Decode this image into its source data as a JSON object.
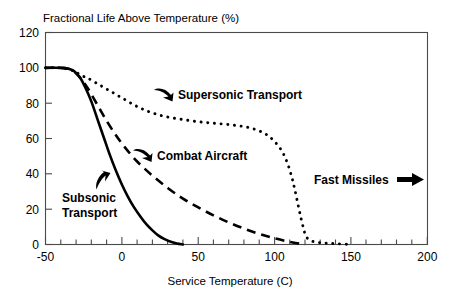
{
  "chart_data": {
    "type": "line",
    "title": "Fractional Life Above Temperature (%)",
    "xlabel": "Service Temperature (C)",
    "ylabel": "",
    "xlim": [
      -50,
      200
    ],
    "ylim": [
      0,
      120
    ],
    "xticks": [
      -50,
      0,
      50,
      100,
      150,
      200
    ],
    "xtick_labels": [
      "-50",
      "0",
      "50",
      "100",
      "150",
      "200"
    ],
    "yticks": [
      0,
      20,
      40,
      60,
      80,
      100,
      120
    ],
    "ytick_labels": [
      "0",
      "20",
      "40",
      "60",
      "80",
      "100",
      "120"
    ],
    "x_minor_tick_step": 10,
    "grid": false,
    "legend": "none",
    "series": [
      {
        "name": "Subsonic Transport",
        "style": "solid",
        "x": [
          -50,
          -40,
          -35,
          -32,
          -30,
          -27,
          -24,
          -20,
          -16,
          -12,
          -8,
          -4,
          0,
          4,
          8,
          12,
          16,
          20,
          24,
          28,
          32,
          36,
          40
        ],
        "values": [
          100,
          100,
          99.5,
          98.5,
          97,
          94,
          89,
          81,
          71,
          61,
          51,
          42,
          34,
          27,
          21,
          16,
          11.5,
          8,
          5,
          3,
          1.5,
          0.6,
          0
        ]
      },
      {
        "name": "Combat Aircraft",
        "style": "dashed",
        "x": [
          -50,
          -40,
          -35,
          -32,
          -30,
          -26,
          -22,
          -16,
          -10,
          -4,
          2,
          10,
          20,
          30,
          40,
          50,
          60,
          70,
          80,
          90,
          100,
          110,
          120
        ],
        "values": [
          100,
          100,
          99.5,
          98.5,
          97,
          93,
          88,
          79,
          70,
          62,
          55,
          47,
          39,
          32,
          26,
          21,
          16.5,
          12.5,
          9,
          6,
          3.5,
          1.5,
          0
        ]
      },
      {
        "name": "Supersonic Transport",
        "style": "dotted",
        "x": [
          -50,
          -40,
          -34,
          -30,
          -26,
          -22,
          -16,
          -10,
          -4,
          2,
          8,
          14,
          20,
          28,
          38,
          50,
          62,
          74,
          84,
          92,
          98,
          104,
          108,
          111,
          113,
          115,
          117,
          119,
          121,
          126,
          133,
          141,
          150
        ],
        "values": [
          100,
          100,
          99,
          97.5,
          95.5,
          94,
          91,
          88,
          85,
          82,
          79,
          76.5,
          74.5,
          72.5,
          71,
          69.5,
          68.5,
          67.5,
          66,
          63.5,
          60,
          54,
          47,
          39,
          32,
          24,
          16,
          9,
          4,
          1.5,
          0.8,
          0.4,
          0
        ]
      }
    ],
    "annotations": [
      {
        "label": "Supersonic Transport",
        "kind": "curved-arrow-label"
      },
      {
        "label": "Combat Aircraft",
        "kind": "curved-arrow-label"
      },
      {
        "label": "Subsonic Transport",
        "kind": "curved-arrow-label",
        "line1": "Subsonic",
        "line2": "Transport"
      },
      {
        "label": "Fast Missiles",
        "kind": "straight-arrow-label"
      }
    ],
    "colors": {
      "background": "#ffffff",
      "ink": "#000000",
      "axis": "#4a4a4a"
    }
  },
  "title": {
    "text": "Fractional Life Above Temperature (%)"
  },
  "xaxis": {
    "title": "Service Temperature (C)",
    "ticks": [
      "-50",
      "0",
      "50",
      "100",
      "150",
      "200"
    ]
  },
  "yaxis": {
    "ticks": [
      "0",
      "20",
      "40",
      "60",
      "80",
      "100",
      "120"
    ]
  },
  "annotations": {
    "supersonic": "Supersonic Transport",
    "combat": "Combat Aircraft",
    "subsonic_line1": "Subsonic",
    "subsonic_line2": "Transport",
    "fast_missiles": "Fast Missiles"
  }
}
